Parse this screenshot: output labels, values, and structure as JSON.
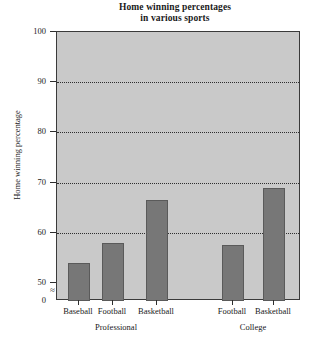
{
  "chart_data": {
    "type": "bar",
    "title": "Home winning percentages in various sports",
    "title_line1": "Home winning percentages",
    "title_line2": "in various sports",
    "xlabel": "",
    "ylabel": "Home winning percentage",
    "categories": [
      "Baseball",
      "Football",
      "Basketball",
      "Football",
      "Basketball"
    ],
    "values": [
      54,
      58,
      66.5,
      57.5,
      69
    ],
    "groups": [
      {
        "name": "Professional",
        "categories": [
          "Baseball",
          "Football",
          "Basketball"
        ],
        "values": [
          54,
          58,
          66.5
        ]
      },
      {
        "name": "College",
        "categories": [
          "Football",
          "Basketball"
        ],
        "values": [
          57.5,
          69
        ]
      }
    ],
    "ylim": [
      0,
      100
    ],
    "y_axis_broken": true,
    "y_break_symbol": "≈",
    "y_ticks": [
      0,
      50,
      60,
      70,
      80,
      90,
      100
    ],
    "y_tick_labels": [
      "0",
      "50",
      "60",
      "70",
      "80",
      "90",
      "100"
    ],
    "gridlines": [
      60,
      70,
      80,
      90
    ],
    "grid": true,
    "legend": null,
    "legend_position": "none",
    "plot_background_color": "#c9c9c9",
    "bar_color": "#777777",
    "axis_color": "#2e2e2e"
  },
  "figure": {
    "background_color": "#ffffff"
  }
}
